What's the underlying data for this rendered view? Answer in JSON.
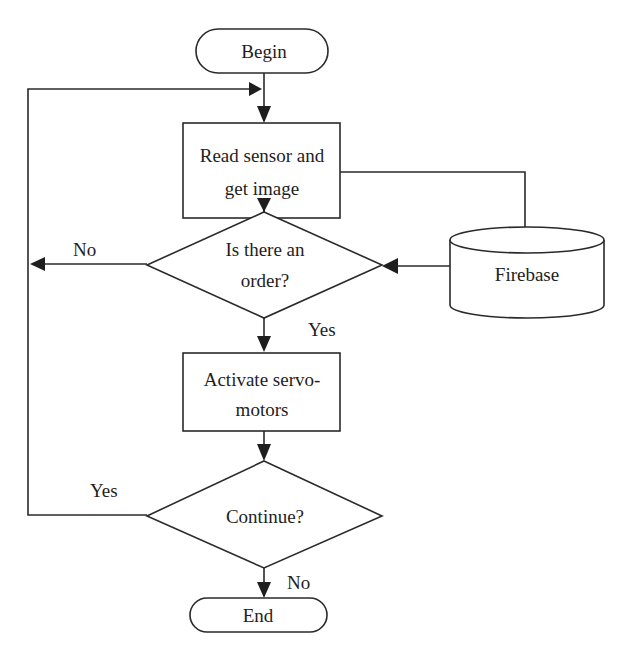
{
  "diagram": {
    "type": "flowchart",
    "nodes": {
      "begin": {
        "label": "Begin",
        "shape": "terminator"
      },
      "read": {
        "label_lines": [
          "Read sensor and",
          "get image"
        ],
        "shape": "process"
      },
      "order": {
        "label_lines": [
          "Is there an",
          "order?"
        ],
        "shape": "decision"
      },
      "firebase": {
        "label": "Firebase",
        "shape": "database"
      },
      "activate": {
        "label_lines": [
          "Activate servo-",
          "motors"
        ],
        "shape": "process"
      },
      "continue": {
        "label": "Continue?",
        "shape": "decision"
      },
      "end": {
        "label": "End",
        "shape": "terminator"
      }
    },
    "edge_labels": {
      "order_no": "No",
      "order_yes": "Yes",
      "continue_yes": "Yes",
      "continue_no": "No"
    },
    "edges": [
      {
        "from": "begin",
        "to": "read"
      },
      {
        "from": "read",
        "to": "order"
      },
      {
        "from": "read",
        "to": "firebase"
      },
      {
        "from": "firebase",
        "to": "order"
      },
      {
        "from": "order",
        "to": "loop",
        "label": "No"
      },
      {
        "from": "order",
        "to": "activate",
        "label": "Yes"
      },
      {
        "from": "activate",
        "to": "continue"
      },
      {
        "from": "continue",
        "to": "read",
        "label": "Yes"
      },
      {
        "from": "continue",
        "to": "end",
        "label": "No"
      }
    ]
  }
}
